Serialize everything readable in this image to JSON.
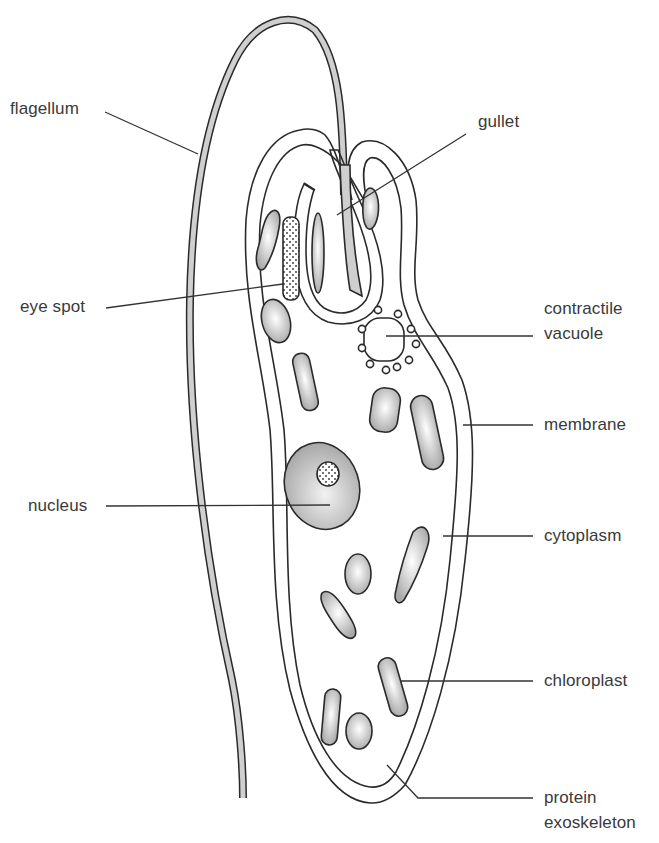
{
  "diagram": {
    "type": "labelled biology diagram",
    "colors": {
      "background": "#ffffff",
      "outline": "#2a2a2a",
      "cytoplasm": "#c9c9c9",
      "flagellum_fill": "#cfcfcf",
      "label_text": "#3a3a3a"
    },
    "labels": {
      "flagellum": "flagellum",
      "gullet": "gullet",
      "eye_spot": "eye spot",
      "contractile_vacuole_1": "contractile",
      "contractile_vacuole_2": "vacuole",
      "membrane": "membrane",
      "nucleus": "nucleus",
      "cytoplasm": "cytoplasm",
      "chloroplast": "chloroplast",
      "protein_exoskeleton_1": "protein",
      "protein_exoskeleton_2": "exoskeleton"
    }
  }
}
